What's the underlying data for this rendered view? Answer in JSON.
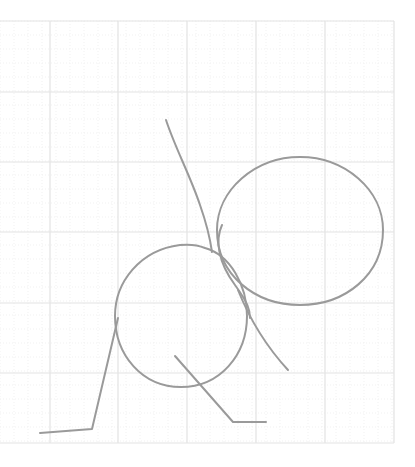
{
  "canvas": {
    "width": 415,
    "height": 467,
    "background": "#ffffff",
    "grid": {
      "left": 0,
      "top": 21,
      "right": 394,
      "bottom": 443,
      "major_x": [
        50,
        118,
        187,
        256,
        325,
        394
      ],
      "major_y": [
        21,
        92,
        162,
        232,
        303,
        373,
        443
      ],
      "major_color": "#e3e3e3",
      "minor_step": 14,
      "minor_color": "#f1f1f1"
    },
    "stroke_color": "#9a9a9a",
    "stroke_width": 2,
    "strokes": [
      {
        "name": "upper-curve-stroke",
        "d": "M166,120 C176,150 190,175 200,205 C206,222 210,238 212,252"
      },
      {
        "name": "upper-right-circle",
        "d": "M300,157 C345,157 383,190 383,230 C383,275 345,305 300,305 C255,305 217,275 217,230 C217,190 255,157 300,157 Z"
      },
      {
        "name": "lower-circle",
        "d": "M205,248 C230,255 247,285 247,316 C247,355 220,387 181,387 C142,387 115,355 115,316 C115,282 140,250 180,245 C190,244 198,245 205,248"
      },
      {
        "name": "inner-arc-stroke",
        "d": "M222,225 C215,240 218,262 235,285 C248,303 250,310 250,318"
      },
      {
        "name": "right-diagonal-stroke",
        "d": "M238,290 C250,320 265,345 288,370"
      },
      {
        "name": "left-polyline-stroke",
        "d": "M40,433 L92,429 L118,318"
      },
      {
        "name": "bottom-polyline-stroke",
        "d": "M175,356 L233,422 L266,422"
      }
    ]
  }
}
